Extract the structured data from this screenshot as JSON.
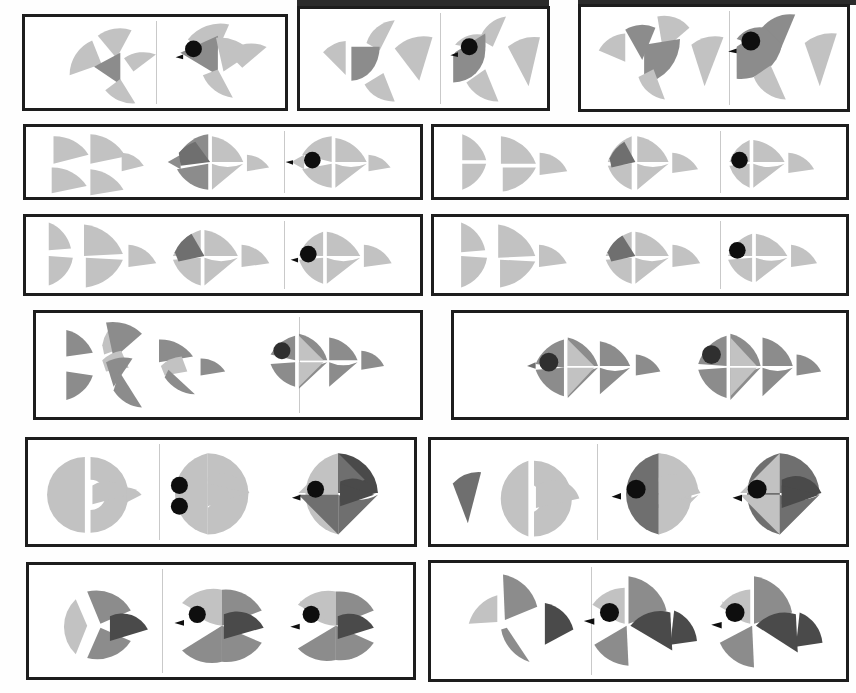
{
  "sheet": {
    "title": "Geometric Fish Construction Sheet",
    "description": "Reference sheet of fish illustrations built from circle sectors and triangles, shown in exploded, assembled and colored stages.",
    "width": 856,
    "height": 693,
    "background": "#ffffff",
    "panel_border_color": "#1d1d1d",
    "divider_color": "#c9c9c9"
  },
  "palette": {
    "light_gray": "#c2c2c2",
    "light_gray_2": "#bdbdbd",
    "mid_gray": "#8c8c8c",
    "mid_gray_2": "#949494",
    "dark_gray": "#6f6f6f",
    "darkest_gray": "#4a4a4a",
    "eye_black": "#0e0e0e",
    "paper_white": "#ffffff"
  },
  "stage_labels": {
    "exploded": "exploded-parts",
    "assembled": "assembled-outline",
    "finished": "finished-colored"
  },
  "rows": [
    {
      "id": "row-1",
      "name": "triangular-fan-fish",
      "panel_count": 3,
      "panels": [
        {
          "id": "r1-p1",
          "cells": 2,
          "stages": [
            "exploded-parts",
            "finished-colored"
          ],
          "fish": "angular-triangle-fish"
        },
        {
          "id": "r1-p2",
          "cells": 2,
          "stages": [
            "exploded-parts",
            "finished-colored"
          ],
          "fish": "half-disc-body-fish"
        },
        {
          "id": "r1-p3",
          "cells": 2,
          "stages": [
            "exploded-parts",
            "finished-colored"
          ],
          "fish": "quarter-disc-body-fish"
        }
      ]
    },
    {
      "id": "row-2",
      "name": "stacked-triangle-fish",
      "panel_count": 2,
      "panels": [
        {
          "id": "r2-p1",
          "cells": 3,
          "stages": [
            "exploded-parts",
            "assembled-outline",
            "finished-colored"
          ],
          "fish": "four-triangle-fish"
        },
        {
          "id": "r2-p2",
          "cells": 2,
          "stages": [
            "exploded-parts",
            "finished-colored"
          ],
          "fish": "three-triangle-fish"
        }
      ]
    },
    {
      "id": "row-3",
      "name": "wide-triangle-fish",
      "panel_count": 2,
      "panels": [
        {
          "id": "r3-p1",
          "cells": 3,
          "stages": [
            "exploded-parts",
            "assembled-outline",
            "finished-colored"
          ],
          "fish": "bowtie-triangle-fish"
        },
        {
          "id": "r3-p2",
          "cells": 2,
          "stages": [
            "exploded-parts",
            "finished-colored"
          ],
          "fish": "bowtie-triangle-fish-variant"
        }
      ]
    },
    {
      "id": "row-4",
      "name": "multi-triangle-angelfish",
      "panel_count": 2,
      "panels": [
        {
          "id": "r4-p1",
          "cells": 2,
          "stages": [
            "exploded-parts",
            "finished-colored"
          ],
          "fish": "eight-triangle-angelfish"
        },
        {
          "id": "r4-p2",
          "cells": 2,
          "stages": [
            "finished-colored",
            "finished-colored"
          ],
          "fish": "eight-triangle-angelfish-pair"
        }
      ]
    },
    {
      "id": "row-5",
      "name": "half-disc-butterflyfish",
      "panel_count": 2,
      "panels": [
        {
          "id": "r5-p1",
          "cells": 2,
          "stages": [
            "exploded-parts",
            "finished-colored"
          ],
          "fish": "round-butterflyfish"
        },
        {
          "id": "r5-p2",
          "cells": 2,
          "stages": [
            "exploded-parts",
            "finished-colored"
          ],
          "fish": "round-butterflyfish-two-tone"
        }
      ]
    },
    {
      "id": "row-6",
      "name": "pinwheel-fish",
      "panel_count": 2,
      "panels": [
        {
          "id": "r6-p1",
          "cells": 2,
          "stages": [
            "exploded-parts",
            "finished-colored"
          ],
          "fish": "four-sector-pinwheel-fish"
        },
        {
          "id": "r6-p2",
          "cells": 2,
          "stages": [
            "exploded-parts",
            "finished-colored"
          ],
          "fish": "four-sector-pinwheel-fish-tilted"
        }
      ]
    }
  ],
  "counts": {
    "total_panels": 13,
    "total_fish_figures": 28,
    "rows": 6
  }
}
